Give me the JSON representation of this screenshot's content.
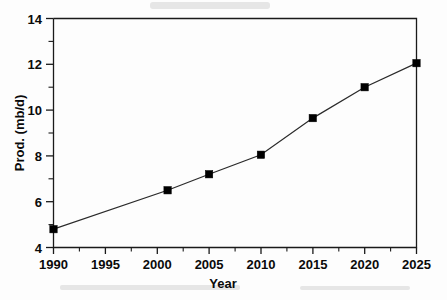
{
  "chart_data": {
    "type": "line",
    "title": "",
    "subtitle": "",
    "xlabel": "Year",
    "ylabel": "Prod. (mb/d)",
    "xlim": [
      1990,
      2025
    ],
    "ylim": [
      4,
      14
    ],
    "grid": false,
    "legend": null,
    "x_ticks_major": [
      1990,
      1995,
      2000,
      2005,
      2010,
      2015,
      2020,
      2025
    ],
    "x_tick_labels": [
      "1990",
      "1995",
      "2000",
      "2005",
      "2010",
      "2015",
      "2020",
      "2025"
    ],
    "x_ticks_minor": [
      1992.5,
      1997.5,
      2002.5,
      2007.5,
      2012.5,
      2017.5,
      2022.5
    ],
    "y_ticks_major": [
      4,
      6,
      8,
      10,
      12,
      14
    ],
    "y_tick_labels": [
      "4",
      "6",
      "8",
      "10",
      "12",
      "14"
    ],
    "y_ticks_minor": [
      5,
      7,
      9,
      11,
      13
    ],
    "series": [
      {
        "name": "Production",
        "marker": "filled-square",
        "color": "#000000",
        "x": [
          1990,
          2001,
          2005,
          2010,
          2015,
          2020,
          2025
        ],
        "values": [
          4.8,
          6.5,
          7.2,
          8.05,
          9.65,
          11.0,
          12.05
        ]
      }
    ],
    "points": [
      {
        "x": 1990,
        "y": 4.8
      },
      {
        "x": 2001,
        "y": 6.5
      },
      {
        "x": 2005,
        "y": 7.2
      },
      {
        "x": 2010,
        "y": 8.05
      },
      {
        "x": 2015,
        "y": 9.65
      },
      {
        "x": 2020,
        "y": 11.0
      },
      {
        "x": 2025,
        "y": 12.05
      }
    ],
    "annotations": []
  },
  "axis": {
    "x_title": "Year",
    "y_title": "Prod. (mb/d)"
  },
  "colors": {
    "line": "#2a2a2a",
    "marker": "#000000",
    "frame": "#1a1a1a",
    "background": "#ffffff"
  }
}
